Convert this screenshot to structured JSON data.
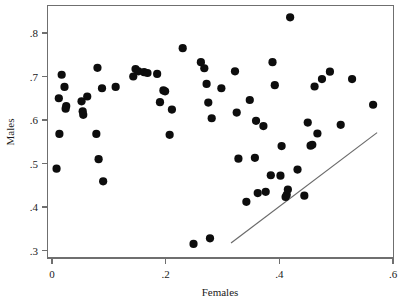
{
  "chart_data": {
    "type": "scatter",
    "title": "",
    "xlabel": "Females",
    "ylabel": "Males",
    "xlim": [
      0,
      0.6
    ],
    "ylim": [
      0.3,
      0.84
    ],
    "grid": false,
    "legend": null,
    "xticks": [
      0,
      0.2,
      0.4,
      0.6
    ],
    "xtick_labels": [
      "0",
      ".2",
      ".4",
      ".6"
    ],
    "yticks": [
      0.3,
      0.4,
      0.5,
      0.6,
      0.7,
      0.8
    ],
    "ytick_labels": [
      ".3",
      ".4",
      ".5",
      ".6",
      ".7",
      ".8"
    ],
    "marker_color": "#0d0d0d",
    "marker_size": 4.1,
    "series": [
      {
        "name": "observations",
        "points": [
          [
            0.008,
            0.488
          ],
          [
            0.012,
            0.65
          ],
          [
            0.013,
            0.568
          ],
          [
            0.017,
            0.704
          ],
          [
            0.022,
            0.676
          ],
          [
            0.024,
            0.626
          ],
          [
            0.025,
            0.632
          ],
          [
            0.052,
            0.643
          ],
          [
            0.054,
            0.62
          ],
          [
            0.055,
            0.612
          ],
          [
            0.062,
            0.654
          ],
          [
            0.078,
            0.568
          ],
          [
            0.08,
            0.72
          ],
          [
            0.082,
            0.51
          ],
          [
            0.088,
            0.673
          ],
          [
            0.09,
            0.459
          ],
          [
            0.112,
            0.676
          ],
          [
            0.143,
            0.7
          ],
          [
            0.147,
            0.717
          ],
          [
            0.152,
            0.712
          ],
          [
            0.162,
            0.71
          ],
          [
            0.168,
            0.708
          ],
          [
            0.185,
            0.706
          ],
          [
            0.19,
            0.641
          ],
          [
            0.196,
            0.668
          ],
          [
            0.199,
            0.666
          ],
          [
            0.207,
            0.566
          ],
          [
            0.211,
            0.624
          ],
          [
            0.23,
            0.765
          ],
          [
            0.249,
            0.315
          ],
          [
            0.262,
            0.733
          ],
          [
            0.268,
            0.719
          ],
          [
            0.272,
            0.683
          ],
          [
            0.275,
            0.64
          ],
          [
            0.278,
            0.328
          ],
          [
            0.281,
            0.604
          ],
          [
            0.298,
            0.673
          ],
          [
            0.322,
            0.712
          ],
          [
            0.325,
            0.617
          ],
          [
            0.328,
            0.511
          ],
          [
            0.342,
            0.412
          ],
          [
            0.348,
            0.646
          ],
          [
            0.357,
            0.513
          ],
          [
            0.359,
            0.598
          ],
          [
            0.362,
            0.432
          ],
          [
            0.372,
            0.586
          ],
          [
            0.376,
            0.435
          ],
          [
            0.385,
            0.473
          ],
          [
            0.388,
            0.733
          ],
          [
            0.392,
            0.68
          ],
          [
            0.402,
            0.472
          ],
          [
            0.404,
            0.54
          ],
          [
            0.411,
            0.423
          ],
          [
            0.413,
            0.428
          ],
          [
            0.415,
            0.44
          ],
          [
            0.419,
            0.836
          ],
          [
            0.432,
            0.486
          ],
          [
            0.444,
            0.426
          ],
          [
            0.45,
            0.594
          ],
          [
            0.455,
            0.541
          ],
          [
            0.458,
            0.543
          ],
          [
            0.462,
            0.677
          ],
          [
            0.467,
            0.569
          ],
          [
            0.475,
            0.694
          ],
          [
            0.489,
            0.711
          ],
          [
            0.508,
            0.589
          ],
          [
            0.528,
            0.694
          ],
          [
            0.565,
            0.635
          ]
        ]
      }
    ],
    "reference_line": {
      "name": "diagonal-reference-line",
      "start": [
        0.315,
        0.317
      ],
      "end": [
        0.572,
        0.571
      ],
      "color": "#6a6a6a"
    }
  },
  "axes": {
    "y_title": "Males",
    "x_title": "Females"
  }
}
